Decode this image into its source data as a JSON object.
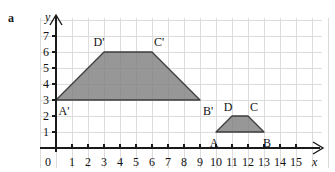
{
  "figure": {
    "part_label": "a",
    "background_color": "#ffffff",
    "grid_color": "#dcdcdc",
    "axis_color": "#1a1a1a",
    "shape_fill_color": "#808080",
    "shape_stroke_color": "#3c3c3c"
  },
  "chart_data": {
    "type": "scatter",
    "title": "",
    "xlabel": "x",
    "ylabel": "y",
    "xlim": [
      0,
      15.8
    ],
    "ylim": [
      0,
      7.6
    ],
    "grid": true,
    "legend": "none",
    "x_ticks": [
      "0",
      "1",
      "2",
      "3",
      "4",
      "5",
      "6",
      "7",
      "8",
      "9",
      "10",
      "11",
      "12",
      "13",
      "14",
      "15"
    ],
    "y_ticks": [
      "1",
      "2",
      "3",
      "4",
      "5",
      "6",
      "7"
    ],
    "origin_label": "0",
    "shapes": [
      {
        "name": "trapezoid-image",
        "labels": [
          "A'",
          "B'",
          "C'",
          "D'"
        ],
        "vertices": [
          {
            "label": "A'",
            "x": 0,
            "y": 3,
            "label_dx": 8,
            "label_dy": 11
          },
          {
            "label": "B'",
            "x": 9,
            "y": 3,
            "label_dx": 8,
            "label_dy": 11
          },
          {
            "label": "C'",
            "x": 6,
            "y": 6,
            "label_dx": 7,
            "label_dy": -10
          },
          {
            "label": "D'",
            "x": 3,
            "y": 6,
            "label_dx": -5,
            "label_dy": -10
          }
        ],
        "path_order": [
          "A'",
          "D'",
          "C'",
          "B'"
        ]
      },
      {
        "name": "trapezoid-original",
        "labels": [
          "A",
          "B",
          "C",
          "D"
        ],
        "vertices": [
          {
            "label": "A",
            "x": 10,
            "y": 1,
            "label_dx": -2,
            "label_dy": 11
          },
          {
            "label": "B",
            "x": 13,
            "y": 1,
            "label_dx": 3,
            "label_dy": 11
          },
          {
            "label": "C",
            "x": 12,
            "y": 2,
            "label_dx": 6,
            "label_dy": -9
          },
          {
            "label": "D",
            "x": 11,
            "y": 2,
            "label_dx": -4,
            "label_dy": -9
          }
        ],
        "path_order": [
          "A",
          "D",
          "C",
          "B"
        ]
      }
    ]
  }
}
